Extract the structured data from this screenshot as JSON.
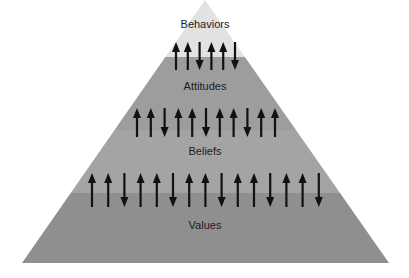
{
  "diagram": {
    "type": "pyramid",
    "apex": [
      205,
      0
    ],
    "base_y": 263,
    "base_left_x": 22,
    "base_right_x": 389,
    "tiers": [
      {
        "label": "Behaviors",
        "top_y": 0,
        "bottom_y": 57,
        "color": "#e2e2e2",
        "label_y": 25,
        "arrows": [
          "up",
          "up",
          "down",
          "up",
          "up",
          "down"
        ],
        "arrow_x_start": 176,
        "arrow_spacing": 11.8,
        "arrow_top": 42,
        "arrow_bottom": 70
      },
      {
        "label": "Attitudes",
        "top_y": 57,
        "bottom_y": 130,
        "color": "#9d9d9d",
        "label_y": 87,
        "arrows": [
          "up",
          "up",
          "down",
          "up",
          "up",
          "down",
          "up",
          "up",
          "down",
          "up",
          "up"
        ],
        "arrow_x_start": 137,
        "arrow_spacing": 13.8,
        "arrow_top": 108,
        "arrow_bottom": 137
      },
      {
        "label": "Beliefs",
        "top_y": 130,
        "bottom_y": 193,
        "color": "#a4a4a4",
        "label_y": 152,
        "arrows": [
          "up",
          "up",
          "down",
          "up",
          "up",
          "down",
          "up",
          "up",
          "down",
          "up",
          "up",
          "down",
          "up",
          "up",
          "down"
        ],
        "arrow_x_start": 92,
        "arrow_spacing": 16.2,
        "arrow_top": 173,
        "arrow_bottom": 207
      },
      {
        "label": "Values",
        "top_y": 193,
        "bottom_y": 263,
        "color": "#8f8f8f",
        "label_y": 226,
        "arrows": []
      }
    ],
    "arrow_color": "#111111"
  }
}
